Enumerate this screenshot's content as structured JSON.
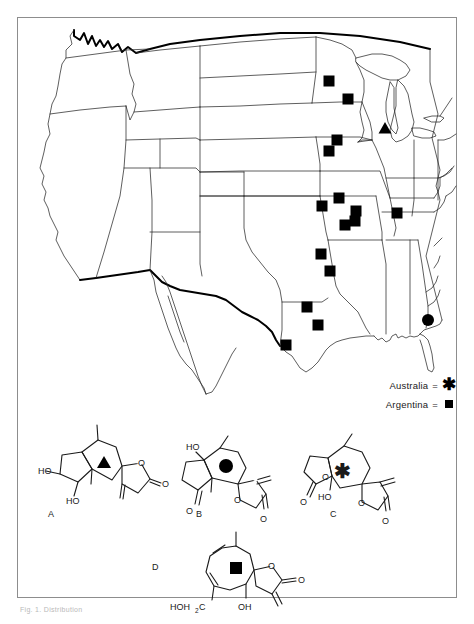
{
  "figure": {
    "caption": "Fig. 1. Distribution",
    "frame": {
      "x": 17,
      "y": 17,
      "width": 440,
      "height": 581
    }
  },
  "map": {
    "name": "united-states-outline-map",
    "title": "",
    "markers": [
      {
        "type": "square",
        "x": 329,
        "y": 81,
        "region": "North Dakota"
      },
      {
        "type": "square",
        "x": 348,
        "y": 99,
        "region": "Minnesota"
      },
      {
        "type": "triangle",
        "x": 385,
        "y": 128,
        "region": "Wisconsin"
      },
      {
        "type": "square",
        "x": 337,
        "y": 140,
        "region": "South Dakota"
      },
      {
        "type": "square",
        "x": 329,
        "y": 151,
        "region": "South Dakota"
      },
      {
        "type": "square",
        "x": 339,
        "y": 198,
        "region": "Nebraska"
      },
      {
        "type": "square",
        "x": 322,
        "y": 206,
        "region": "Nebraska"
      },
      {
        "type": "square",
        "x": 356,
        "y": 211,
        "region": "Iowa"
      },
      {
        "type": "square",
        "x": 397,
        "y": 213,
        "region": "Illinois"
      },
      {
        "type": "square",
        "x": 355,
        "y": 221,
        "region": "Missouri"
      },
      {
        "type": "square",
        "x": 345,
        "y": 225,
        "region": "Kansas"
      },
      {
        "type": "square",
        "x": 321,
        "y": 254,
        "region": "Kansas"
      },
      {
        "type": "square",
        "x": 330,
        "y": 271,
        "region": "Oklahoma"
      },
      {
        "type": "square",
        "x": 307,
        "y": 307,
        "region": "Texas"
      },
      {
        "type": "square",
        "x": 318,
        "y": 325,
        "region": "Texas"
      },
      {
        "type": "square",
        "x": 286,
        "y": 345,
        "region": "Texas"
      },
      {
        "type": "circle",
        "x": 428,
        "y": 320,
        "region": "Florida"
      }
    ]
  },
  "legend": {
    "name": "symbol-legend",
    "rows": [
      {
        "label": "Australia",
        "equals": "=",
        "symbol": "asterisk"
      },
      {
        "label": "Argentina",
        "equals": "=",
        "symbol": "square"
      }
    ]
  },
  "structures": [
    {
      "id": "A",
      "label": "A",
      "marker": "triangle",
      "atom_labels": [
        "HO",
        "HO",
        "O",
        "O"
      ],
      "skeleton": "guaianolide"
    },
    {
      "id": "B",
      "label": "B",
      "marker": "circle",
      "atom_labels": [
        "HO",
        "O",
        "O",
        "O"
      ],
      "skeleton": "guaianolide"
    },
    {
      "id": "C",
      "label": "C",
      "marker": "asterisk",
      "atom_labels": [
        "O",
        "O",
        "HO",
        "O",
        "O"
      ],
      "skeleton": "guaianolide-bislactone"
    },
    {
      "id": "D",
      "label": "D",
      "marker": "square",
      "atom_labels": [
        "HOH₂C",
        "OH",
        "O",
        "O"
      ],
      "skeleton": "germacranolide"
    }
  ],
  "colors": {
    "ink": "#1a1a1a",
    "frame": "#8d8d8d",
    "marker": "#000000",
    "background": "#ffffff"
  }
}
